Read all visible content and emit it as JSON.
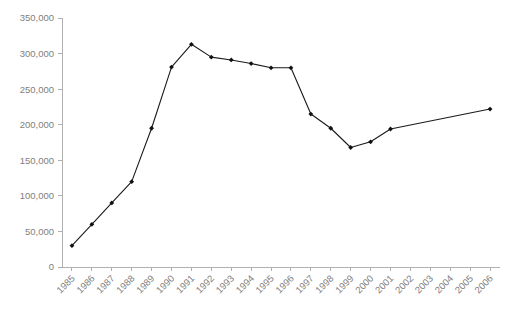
{
  "chart_data": {
    "type": "line",
    "title": "",
    "subtitle": "",
    "xlabel": "",
    "ylabel": "",
    "categories": [
      "1985",
      "1986",
      "1987",
      "1988",
      "1989",
      "1990",
      "1991",
      "1992",
      "1993",
      "1994",
      "1995",
      "1996",
      "1997",
      "1998",
      "1999",
      "2000",
      "2001",
      "2002",
      "2003",
      "2004",
      "2005",
      "2006"
    ],
    "values": [
      30000,
      60000,
      90000,
      120000,
      195000,
      281000,
      313000,
      295000,
      291000,
      286000,
      280000,
      280000,
      215000,
      195000,
      168000,
      176000,
      194000,
      null,
      null,
      null,
      null,
      222000
    ],
    "series": [
      {
        "name": "series-1",
        "values": [
          30000,
          60000,
          90000,
          120000,
          195000,
          281000,
          313000,
          295000,
          291000,
          286000,
          280000,
          280000,
          215000,
          195000,
          168000,
          176000,
          194000,
          null,
          null,
          null,
          null,
          222000
        ]
      }
    ],
    "ylim": [
      0,
      350000
    ],
    "yticks": [
      0,
      50000,
      100000,
      150000,
      200000,
      250000,
      300000,
      350000
    ],
    "ytick_labels": [
      "0",
      "50,000",
      "100,000",
      "150,000",
      "200,000",
      "250,000",
      "300,000",
      "350,000"
    ],
    "xtick_labels": [
      "1985",
      "1986",
      "1987",
      "1988",
      "1989",
      "1990",
      "1991",
      "1992",
      "1993",
      "1994",
      "1995",
      "1996",
      "1997",
      "1998",
      "1999",
      "2000",
      "2001",
      "2002",
      "2003",
      "2004",
      "2005",
      "2006"
    ],
    "xtick_label_rotation": -45,
    "grid": false,
    "legend": false,
    "legend_position": "none",
    "marker": "filled-diamond",
    "line_color": "#1a1a1a",
    "axis_color": "#b0b0b0",
    "tick_label_color": "#808080",
    "background_color": "#ffffff",
    "annotations": []
  },
  "layout": {
    "plot_left": 62,
    "plot_right": 500,
    "plot_top": 18,
    "plot_bottom": 267
  }
}
